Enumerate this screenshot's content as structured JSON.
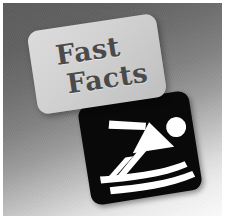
{
  "graphic": {
    "title": "Fast Facts",
    "card": {
      "line1": "Fast",
      "line2": "Facts",
      "text_color": "#4a4a4a",
      "surface_color": "#d4d4d4"
    },
    "sign": {
      "name": "skiing-pictogram-sign",
      "background_color": "#090909",
      "symbol_color": "#ffffff",
      "symbol_label": "downhill-skier",
      "parts": [
        "ski-pole",
        "torso-triangle",
        "head-circle",
        "front-leg",
        "back-leg",
        "upper-ski",
        "lower-ski"
      ]
    },
    "background": {
      "style": "diagonal-gray-gradient",
      "dark_color": "#5c5c5c",
      "light_color": "#fbfbfb"
    },
    "frame": {
      "color": "#ffffff",
      "width_px": 3
    }
  }
}
